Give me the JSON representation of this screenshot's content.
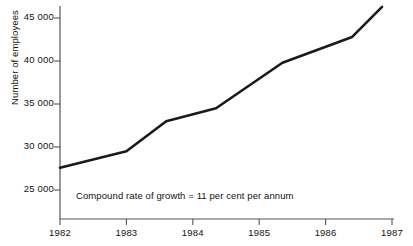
{
  "chart_data": {
    "type": "line",
    "title": "",
    "xlabel": "",
    "ylabel": "Number of employees",
    "xlim": [
      1982,
      1987
    ],
    "ylim": [
      22900,
      46800
    ],
    "grid": false,
    "legend": "none",
    "x_ticks": [
      "1982",
      "1983",
      "1984",
      "1985",
      "1986",
      "1987"
    ],
    "x_tick_values": [
      1982,
      1983,
      1984,
      1985,
      1986,
      1987
    ],
    "y_ticks": [
      "25 000",
      "30 000",
      "35 000",
      "40 000",
      "45 000"
    ],
    "y_tick_values": [
      25000,
      30000,
      35000,
      40000,
      45000
    ],
    "series": [
      {
        "name": "Number of employees",
        "color": "#1a1a1a",
        "x": [
          1982.0,
          1983.0,
          1983.6,
          1984.35,
          1985.35,
          1986.4,
          1986.85
        ],
        "values": [
          27600,
          29500,
          33000,
          34500,
          39800,
          42800,
          46300
        ]
      }
    ],
    "annotations": [
      {
        "text": "Compound rate of growth = 11 per cent per annum",
        "x": 1982.25,
        "y": 23800
      }
    ]
  },
  "axis": {
    "line_color": "#555555",
    "tick_color": "#555555"
  }
}
